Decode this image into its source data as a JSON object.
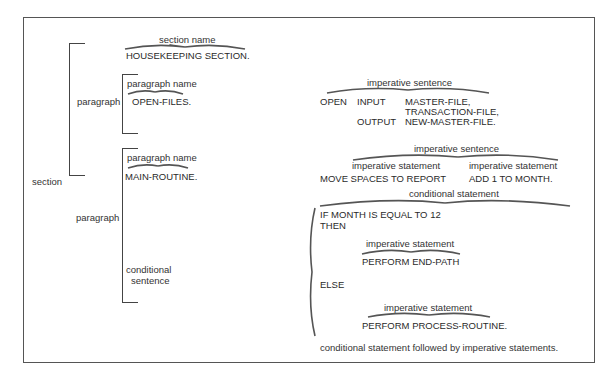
{
  "diagram": {
    "left": {
      "section_label": "section",
      "paragraph1_label": "paragraph",
      "paragraph2_label": "paragraph",
      "conditional_sentence_label": [
        "conditional",
        "sentence"
      ]
    },
    "section_name": {
      "annotation": "section name",
      "code": "HOUSEKEEPING SECTION."
    },
    "paragraph1": {
      "annotation": "paragraph name",
      "code": "OPEN-FILES.",
      "sentence_annotation": "imperative sentence",
      "lines": [
        [
          "OPEN",
          "INPUT",
          "MASTER-FILE,"
        ],
        [
          "",
          "",
          "TRANSACTION-FILE,"
        ],
        [
          "",
          "OUTPUT",
          "NEW-MASTER-FILE."
        ]
      ]
    },
    "paragraph2": {
      "annotation": "paragraph name",
      "code": "MAIN-ROUTINE.",
      "sentence_annotation": "imperative sentence",
      "statement1_annotation": "imperative statement",
      "statement1_code": "MOVE SPACES TO REPORT",
      "statement2_annotation": "imperative statement",
      "statement2_code": "ADD 1 TO MONTH.",
      "conditional": {
        "annotation": "conditional statement",
        "if_line": "IF MONTH IS EQUAL TO 12",
        "then_line": "THEN",
        "then_annotation": "imperative statement",
        "then_code": "PERFORM END-PATH",
        "else_line": "ELSE",
        "else_annotation": "imperative statement",
        "else_code": "PERFORM PROCESS-ROUTINE.",
        "caption": "conditional statement followed by imperative statements."
      }
    }
  }
}
